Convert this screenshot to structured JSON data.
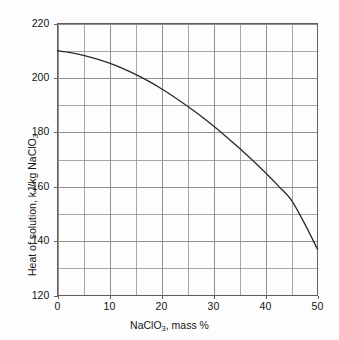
{
  "chart_data": {
    "type": "line",
    "title": "",
    "subtitle": "",
    "xlabel": "NaClO3, mass %",
    "xlabel_parts": {
      "pre": "NaClO",
      "sub": "3",
      "post": ", mass %"
    },
    "ylabel": "Heat of solution, kJ/kg NaClO3",
    "ylabel_parts": {
      "pre": "Heat of solution, kJ/kg NaClO",
      "sub": "3",
      "post": ""
    },
    "xlim": [
      0,
      50
    ],
    "ylim": [
      120,
      220
    ],
    "xticks": [
      0,
      10,
      20,
      30,
      40,
      50
    ],
    "yticks": [
      120,
      140,
      160,
      180,
      200,
      220
    ],
    "xtick_labels": [
      "0",
      "10",
      "20",
      "30",
      "40",
      "50"
    ],
    "ytick_labels": [
      "120",
      "140",
      "160",
      "180",
      "200",
      "220"
    ],
    "x_minor_step": 5,
    "y_minor_step": 10,
    "grid": true,
    "grid_color": "#909090",
    "axes_color": "#606060",
    "line_color": "#2a2a2a",
    "line_width": 1.3,
    "legend": null,
    "legend_position": "none",
    "annotations": [],
    "series": [
      {
        "name": "Heat of solution",
        "x": [
          0,
          2.5,
          5,
          7.5,
          10,
          12.5,
          15,
          17.5,
          20,
          22.5,
          25,
          27.5,
          30,
          32.5,
          35,
          37.5,
          40,
          42.5,
          45,
          47.5,
          50
        ],
        "values": [
          210.0,
          209.3,
          208.3,
          207.0,
          205.4,
          203.5,
          201.3,
          198.8,
          196.0,
          192.9,
          189.6,
          186.1,
          182.3,
          178.3,
          174.1,
          169.7,
          165.1,
          160.2,
          155.0,
          146.5,
          137.0
        ]
      }
    ]
  }
}
